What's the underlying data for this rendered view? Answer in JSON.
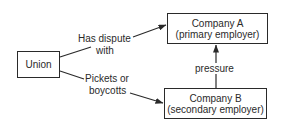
{
  "diagram": {
    "type": "flow",
    "nodes": [
      {
        "id": "union",
        "lines": [
          "Union"
        ]
      },
      {
        "id": "company_a",
        "lines": [
          "Company A",
          "(primary employer)"
        ]
      },
      {
        "id": "company_b",
        "lines": [
          "Company B",
          "(secondary employer)"
        ]
      }
    ],
    "edges": [
      {
        "from": "union",
        "to": "company_a",
        "label_lines": [
          "Has dispute",
          "with"
        ]
      },
      {
        "from": "union",
        "to": "company_b",
        "label_lines": [
          "Pickets or",
          "boycotts"
        ]
      },
      {
        "from": "company_b",
        "to": "company_a",
        "label_lines": [
          "pressure"
        ]
      }
    ],
    "colors": {
      "stroke": "#2a2a2a",
      "background": "#ffffff"
    }
  }
}
